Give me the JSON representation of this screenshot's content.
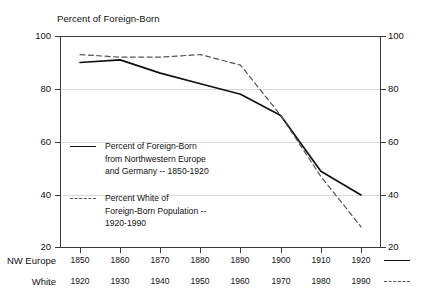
{
  "chart_data": {
    "type": "line",
    "title": "Percent of Foreign-Born",
    "xlabel": "",
    "ylabel": "",
    "ylim": [
      20,
      100
    ],
    "ytick_values": [
      20,
      40,
      60,
      80,
      100
    ],
    "ytick_labels_left": [
      "100",
      "80",
      "60",
      "40",
      "20"
    ],
    "ytick_labels_right": [
      "100",
      "80",
      "60",
      "40",
      "20"
    ],
    "grid": true,
    "legend_position": "inside-lower-left",
    "dual_x_axis": true,
    "x_positions": [
      0,
      1,
      2,
      3,
      4,
      5,
      6,
      7
    ],
    "axis_rows": [
      {
        "row_label": "NW Europe",
        "key_style": "solid",
        "ticks": [
          "1850",
          "1860",
          "1870",
          "1880",
          "1890",
          "1900",
          "1910",
          "1920"
        ]
      },
      {
        "row_label": "White",
        "key_style": "dashed",
        "ticks": [
          "1920",
          "1930",
          "1940",
          "1950",
          "1960",
          "1970",
          "1980",
          "1990"
        ]
      }
    ],
    "series": [
      {
        "name": "Percent of Foreign-Born from Northwestern Europe and Germany -- 1850-1920",
        "style": "solid",
        "color": "#111111",
        "x_axis_row": "NW Europe",
        "categories": [
          "1850",
          "1860",
          "1870",
          "1880",
          "1890",
          "1900",
          "1910",
          "1920"
        ],
        "values": [
          90,
          91,
          86,
          82,
          78,
          70,
          49,
          40
        ]
      },
      {
        "name": "Percent White of Foreign-Born Population -- 1920-1990",
        "style": "dashed",
        "color": "#555555",
        "x_axis_row": "White",
        "categories": [
          "1920",
          "1930",
          "1940",
          "1950",
          "1960",
          "1970",
          "1980",
          "1990"
        ],
        "values": [
          93,
          92,
          92,
          93,
          89,
          70,
          47,
          28
        ]
      }
    ]
  },
  "legend": {
    "entries": [
      {
        "key_style": "solid",
        "lines": [
          "Percent of Foreign-Born",
          "from Northwestern Europe",
          "and Germany -- 1850-1920"
        ]
      },
      {
        "key_style": "dashed",
        "lines": [
          "Percent White of",
          "Foreign-Born Population --",
          "1920-1990"
        ]
      }
    ]
  },
  "colors": {
    "axis": "#3a3a3a",
    "grid": "#d8d8d8",
    "series_solid": "#111111",
    "series_dashed": "#555555",
    "background": "#ffffff"
  }
}
